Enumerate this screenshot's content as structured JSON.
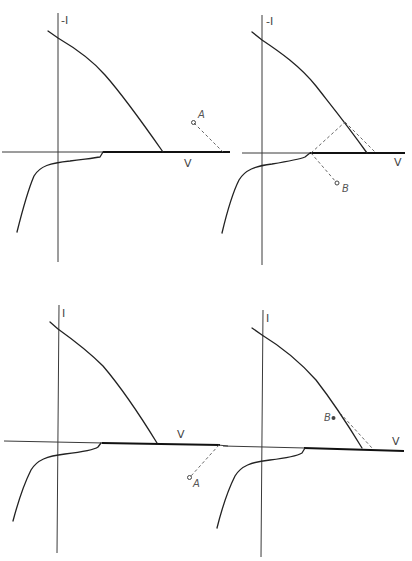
{
  "figure": {
    "panels": [
      {
        "id": "top-left",
        "y_axis_label": "-I",
        "x_axis_label": "V",
        "point_label": "A",
        "note": "Point A above the V axis, dashed line down to V axis"
      },
      {
        "id": "top-right",
        "y_axis_label": "-I",
        "x_axis_label": "V",
        "point_label": "B",
        "note": "Point B below V axis; dashed construction lines forming a triangle with the upper curve"
      },
      {
        "id": "bottom-left",
        "y_axis_label": "I",
        "x_axis_label": "V",
        "point_label": "A",
        "note": "Point A below V axis, dashed line up to V axis"
      },
      {
        "id": "bottom-right",
        "y_axis_label": "I",
        "x_axis_label": "V",
        "point_label": "B",
        "note": "Point B on the upper curve; dashed tangent line to V axis"
      }
    ]
  },
  "colors": {
    "background": "#ffffff",
    "ink": "#222222",
    "dashed": "#555555"
  }
}
